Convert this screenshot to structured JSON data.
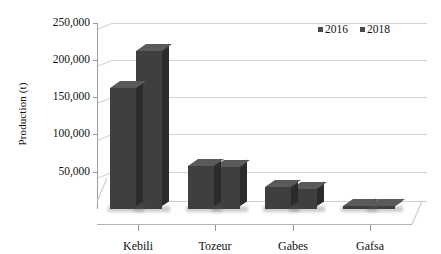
{
  "chart_data": {
    "type": "bar",
    "title": "",
    "subtitle": "",
    "xlabel": "",
    "ylabel": "Production (t)",
    "categories": [
      "Kebili",
      "Tozeur",
      "Gabes",
      "Gafsa"
    ],
    "series": [
      {
        "name": "2016",
        "values": [
          163000,
          58000,
          30000,
          3500
        ],
        "color": "#3f3f3f"
      },
      {
        "name": "2018",
        "values": [
          213000,
          57000,
          27000,
          3500
        ],
        "color": "#3f3f3f"
      }
    ],
    "ylim": [
      0,
      250000
    ],
    "ytick_values": [
      50000,
      100000,
      150000,
      200000,
      250000
    ],
    "ytick_labels": [
      "50,000",
      "100,000",
      "150,000",
      "200,000",
      "250,000"
    ],
    "grid": true,
    "legend_position": "top-right",
    "three_d": true
  },
  "legend": {
    "items": [
      {
        "label": "2016",
        "marker": "square-marker",
        "color": "#4a4a4a"
      },
      {
        "label": "2018",
        "marker": "square-marker",
        "color": "#4a4a4a"
      }
    ]
  },
  "axes": {
    "y_title": "Production (t)",
    "y_labels": [
      "250,000",
      "200,000",
      "150,000",
      "100,000",
      "50,000"
    ],
    "x_labels": [
      "Kebili",
      "Tozeur",
      "Gabes",
      "Gafsa"
    ]
  }
}
